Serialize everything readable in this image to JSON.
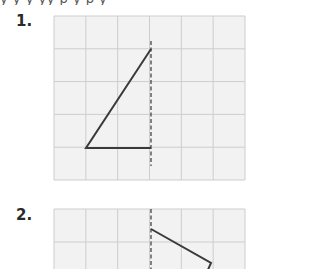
{
  "page": {
    "cutoff_top_text": "y    y    y    yy    p    y    p        y"
  },
  "problems": [
    {
      "label": "1.",
      "grid": {
        "cols": 6,
        "rows": 5,
        "x": 54,
        "y": 16,
        "width": 191,
        "height": 164
      },
      "mirror_line": {
        "style": "dashed",
        "x": 151,
        "y1": 41,
        "y2": 166
      },
      "shape": {
        "type": "polyline",
        "points": [
          [
            151,
            49
          ],
          [
            86,
            148
          ],
          [
            151,
            148
          ]
        ]
      }
    },
    {
      "label": "2.",
      "grid": {
        "cols": 6,
        "rows": 2,
        "x": 54,
        "y": 209,
        "width": 191,
        "height": 66
      },
      "mirror_line": {
        "style": "dashed",
        "x": 151,
        "y1": 209,
        "y2": 269
      },
      "shape": {
        "type": "polyline",
        "points": [
          [
            151,
            229
          ],
          [
            211,
            263
          ],
          [
            207,
            272
          ]
        ]
      }
    }
  ],
  "colors": {
    "grid_fill": "#f2f2f2",
    "grid_line": "#cdcdcd",
    "shape_stroke": "#3a3a3a",
    "mirror_stroke": "#444444",
    "label": "#2a2a2a"
  }
}
